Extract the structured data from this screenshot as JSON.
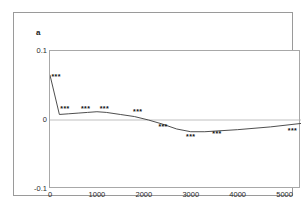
{
  "figure": {
    "panel_label": "a"
  },
  "chart_data": {
    "type": "line",
    "title": "",
    "xlabel": "",
    "ylabel": "",
    "xlim": [
      0,
      5350
    ],
    "ylim": [
      -0.1,
      0.1
    ],
    "grid": false,
    "legend": null,
    "zero_line": 0,
    "y_ticks": [
      {
        "value": 0.1,
        "label": "0.1"
      },
      {
        "value": 0,
        "label": "0"
      },
      {
        "value": -0.1,
        "label": "-0.1"
      }
    ],
    "x_ticks": [
      {
        "value": 0,
        "label": "0"
      },
      {
        "value": 1000,
        "label": "1000"
      },
      {
        "value": 2000,
        "label": "2000"
      },
      {
        "value": 3000,
        "label": "3000"
      },
      {
        "value": 4000,
        "label": "4000"
      },
      {
        "value": 5000,
        "label": "5000"
      }
    ],
    "series": [
      {
        "name": "value",
        "color": "#3a3a3a",
        "x": [
          0,
          200,
          400,
          600,
          800,
          1000,
          1200,
          1500,
          1800,
          2100,
          2400,
          2700,
          3000,
          3300,
          4000,
          4700,
          5350
        ],
        "y": [
          0.065,
          0.008,
          0.009,
          0.01,
          0.011,
          0.012,
          0.011,
          0.008,
          0.005,
          0.0,
          -0.006,
          -0.013,
          -0.017,
          -0.017,
          -0.014,
          -0.01,
          -0.005
        ]
      }
    ],
    "annotations": [
      {
        "text": "***",
        "x": 130,
        "y": 0.063
      },
      {
        "text": "***",
        "x": 320,
        "y": 0.016
      },
      {
        "text": "***",
        "x": 760,
        "y": 0.016
      },
      {
        "text": "***",
        "x": 1160,
        "y": 0.016
      },
      {
        "text": "***",
        "x": 1870,
        "y": 0.011
      },
      {
        "text": "***",
        "x": 2410,
        "y": -0.01
      },
      {
        "text": "***",
        "x": 3000,
        "y": -0.024
      },
      {
        "text": "***",
        "x": 3560,
        "y": -0.02
      },
      {
        "text": "***",
        "x": 5170,
        "y": -0.016
      }
    ]
  }
}
